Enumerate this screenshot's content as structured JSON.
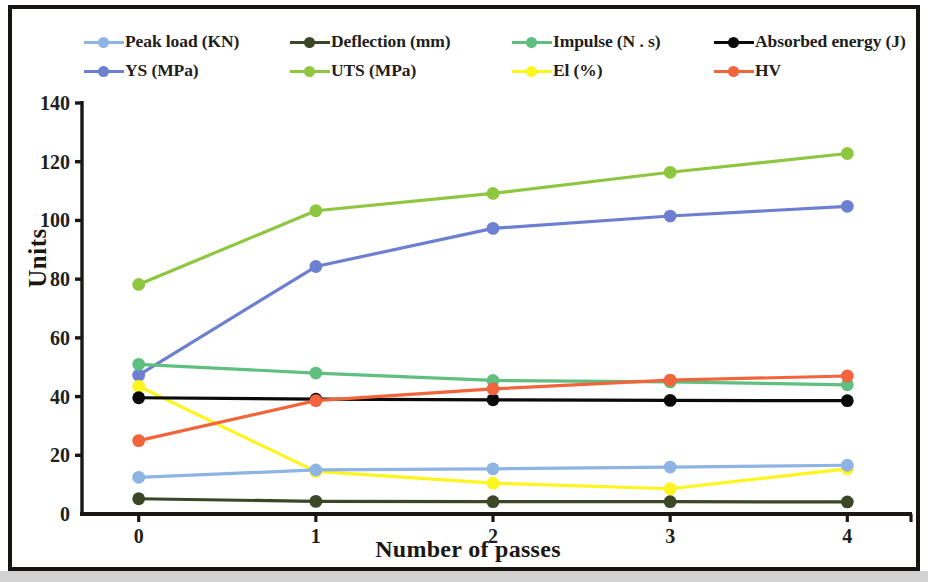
{
  "chart_data": {
    "type": "line",
    "title": "",
    "xlabel": "Number of passes",
    "ylabel": "Units",
    "x": [
      0,
      1,
      2,
      3,
      4
    ],
    "categories": [
      "0",
      "1",
      "2",
      "3",
      "4"
    ],
    "xlim": [
      -0.32,
      4.32
    ],
    "ylim": [
      0,
      140
    ],
    "ytick_labels": [
      "0",
      "20",
      "40",
      "60",
      "80",
      "100",
      "120",
      "140"
    ],
    "yticks": [
      0,
      20,
      40,
      60,
      80,
      100,
      120,
      140
    ],
    "grid": false,
    "legend_position": "top",
    "legend_columns": 4,
    "series": [
      {
        "name": "Peak load (KN)",
        "color": "#8db4e2",
        "values": [
          12.5,
          15.0,
          15.4,
          16.0,
          16.6
        ]
      },
      {
        "name": "Deflection (mm)",
        "color": "#3b4726",
        "values": [
          5.2,
          4.3,
          4.2,
          4.2,
          4.1
        ]
      },
      {
        "name": "Impulse (N . s)",
        "color": "#5fbf7f",
        "values": [
          51.0,
          48.0,
          45.5,
          45.0,
          44.0
        ]
      },
      {
        "name": "Absorbed energy (J)",
        "color": "#0a0a0a",
        "values": [
          39.6,
          39.1,
          38.9,
          38.7,
          38.6
        ]
      },
      {
        "name": "YS (MPa)",
        "color": "#6d7fd0",
        "values": [
          47.3,
          84.3,
          97.3,
          101.5,
          104.8
        ]
      },
      {
        "name": "UTS (MPa)",
        "color": "#8ec640",
        "values": [
          78.2,
          103.3,
          109.2,
          116.4,
          122.8
        ]
      },
      {
        "name": "El (%)",
        "color": "#fff51e",
        "values": [
          43.5,
          14.5,
          10.5,
          8.6,
          15.4
        ]
      },
      {
        "name": "HV",
        "color": "#f1643c",
        "values": [
          25.0,
          38.6,
          42.6,
          45.6,
          47.0
        ]
      }
    ]
  },
  "axis": {
    "ylabel": "Units",
    "xlabel": "Number of passes"
  },
  "colors": {
    "frame": "#171310",
    "axis": "#1b1714",
    "background": "#ffffff",
    "page": "#c9c9c9"
  }
}
